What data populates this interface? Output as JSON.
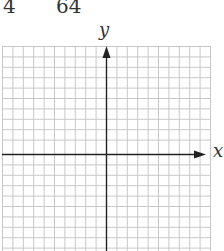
{
  "header": {
    "left_value": "4",
    "right_value": "64"
  },
  "axes": {
    "x_label": "x",
    "y_label": "y"
  },
  "grid": {
    "columns": 20,
    "rows": 20,
    "line_color": "#c8c8c8",
    "axis_color": "#222222"
  }
}
